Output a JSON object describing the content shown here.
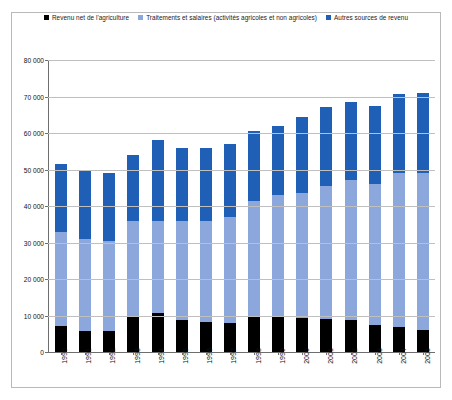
{
  "chart_data": {
    "type": "bar",
    "stacked": true,
    "title": "",
    "xlabel": "",
    "ylabel": "",
    "ylim": [
      0,
      80000
    ],
    "ytick_step": 10000,
    "grid": true,
    "legend_position": "top",
    "categories": [
      "1990",
      "1991",
      "1992",
      "1993",
      "1994",
      "1995",
      "1996",
      "1997",
      "1998",
      "1999",
      "2000",
      "2001",
      "2002",
      "2003",
      "2004",
      "2005"
    ],
    "ytick_labels": [
      "80 000",
      "70 000",
      "60 000",
      "50 000",
      "40 000",
      "30 000",
      "20 000",
      "10 000",
      "0"
    ],
    "ytick_values": [
      80000,
      70000,
      60000,
      50000,
      40000,
      30000,
      20000,
      10000,
      0
    ],
    "series": [
      {
        "name": "Revenu net de l'agriculture",
        "color": "#000000",
        "values": [
          7000,
          5800,
          5800,
          10000,
          10600,
          8700,
          8300,
          7900,
          9900,
          9700,
          9400,
          9100,
          8900,
          7400,
          6800,
          6000
        ]
      },
      {
        "name": "Traitements et salaires (activités agricoles et non agricoles)",
        "color": "#8CA7DC",
        "values": [
          26000,
          25200,
          24700,
          26000,
          25400,
          27300,
          27700,
          29100,
          31600,
          33300,
          34100,
          36400,
          38100,
          38600,
          42200,
          43000
        ]
      },
      {
        "name": "Autres sources de revenu",
        "color": "#1F5FB5",
        "values": [
          18500,
          19000,
          18500,
          18000,
          22000,
          20000,
          20000,
          20000,
          19000,
          19000,
          21000,
          21500,
          21600,
          21400,
          21700,
          22000
        ]
      }
    ],
    "totals": [
      51500,
      50000,
      49000,
      54000,
      58000,
      56000,
      56000,
      57000,
      60500,
      62000,
      64500,
      67000,
      68600,
      67400,
      70700,
      71000
    ]
  },
  "legend": {
    "items": [
      {
        "label": "Revenu net de l'agriculture",
        "color": "#000000"
      },
      {
        "label": "Traitements et salaires  (activités agricoles et non agricoles)",
        "color": "#8CA7DC"
      },
      {
        "label": "Autres sources de revenu",
        "color": "#1F5FB5"
      }
    ]
  }
}
